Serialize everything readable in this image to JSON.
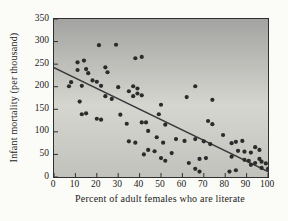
{
  "chart_data": {
    "type": "scatter",
    "title": "",
    "xlabel": "Percent of adult females who are literate",
    "ylabel": "Infant mortality (per thousand)",
    "xlim": [
      0,
      100
    ],
    "ylim": [
      0,
      350
    ],
    "x_ticks": [
      0,
      10,
      20,
      30,
      40,
      50,
      60,
      70,
      80,
      90,
      100
    ],
    "y_ticks": [
      0,
      50,
      100,
      150,
      200,
      250,
      300,
      350
    ],
    "grid": "off",
    "legend": "none",
    "trend_line": {
      "x1": 0,
      "y1": 242,
      "x2": 100,
      "y2": 12
    },
    "points": [
      [
        21,
        292
      ],
      [
        29,
        293
      ],
      [
        11,
        254
      ],
      [
        14,
        258
      ],
      [
        8,
        210
      ],
      [
        11,
        237
      ],
      [
        15,
        239
      ],
      [
        16,
        230
      ],
      [
        24,
        243
      ],
      [
        25,
        232
      ],
      [
        18,
        214
      ],
      [
        20,
        211
      ],
      [
        22,
        202
      ],
      [
        7,
        201
      ],
      [
        13,
        202
      ],
      [
        24,
        179
      ],
      [
        27,
        173
      ],
      [
        12,
        167
      ],
      [
        13,
        139
      ],
      [
        15,
        141
      ],
      [
        20,
        129
      ],
      [
        22,
        127
      ],
      [
        38,
        263
      ],
      [
        41,
        266
      ],
      [
        30,
        199
      ],
      [
        35,
        190
      ],
      [
        37,
        201
      ],
      [
        39,
        196
      ],
      [
        39,
        185
      ],
      [
        37,
        179
      ],
      [
        41,
        181
      ],
      [
        50,
        160
      ],
      [
        49,
        139
      ],
      [
        31,
        138
      ],
      [
        34,
        118
      ],
      [
        41,
        121
      ],
      [
        43,
        121
      ],
      [
        52,
        116
      ],
      [
        44,
        102
      ],
      [
        48,
        88
      ],
      [
        35,
        79
      ],
      [
        38,
        76
      ],
      [
        44,
        60
      ],
      [
        47,
        57
      ],
      [
        42,
        50
      ],
      [
        51,
        76
      ],
      [
        57,
        84
      ],
      [
        55,
        53
      ],
      [
        50,
        42
      ],
      [
        52,
        36
      ],
      [
        61,
        80
      ],
      [
        66,
        84
      ],
      [
        70,
        79
      ],
      [
        68,
        40
      ],
      [
        71,
        42
      ],
      [
        66,
        18
      ],
      [
        68,
        12
      ],
      [
        63,
        31
      ],
      [
        73,
        73
      ],
      [
        62,
        177
      ],
      [
        66,
        201
      ],
      [
        74,
        171
      ],
      [
        72,
        124
      ],
      [
        74,
        117
      ],
      [
        79,
        93
      ],
      [
        83,
        75
      ],
      [
        85,
        78
      ],
      [
        88,
        80
      ],
      [
        94,
        66
      ],
      [
        96,
        60
      ],
      [
        86,
        58
      ],
      [
        89,
        56
      ],
      [
        92,
        54
      ],
      [
        83,
        45
      ],
      [
        89,
        38
      ],
      [
        91,
        36
      ],
      [
        96,
        40
      ],
      [
        92,
        27
      ],
      [
        94,
        31
      ],
      [
        97,
        34
      ],
      [
        99,
        30
      ],
      [
        100,
        18
      ],
      [
        97,
        20
      ],
      [
        85,
        15
      ],
      [
        82,
        12
      ]
    ],
    "colors": {
      "point": "#2b2b2b",
      "trend_line": "#3a3a3c",
      "axis_text": "#1c1c1c",
      "tick_mark": "#2f2f2f",
      "plot_border": "#2f2f2f",
      "plot_bg_top": "#a3a3a1",
      "plot_bg_mid": "#d6d6d0",
      "plot_bg_bottom": "#c2c2bc",
      "page_bg": "#fbfbf8"
    }
  }
}
